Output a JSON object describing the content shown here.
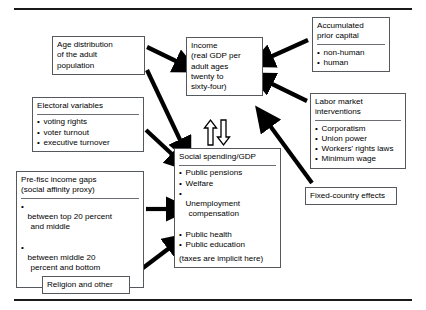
{
  "figure": {
    "type": "flow-diagram",
    "background": "#ffffff",
    "box_border_color": "#55585c",
    "arrow_color": "#000000",
    "rule_color": "#1a1a1a"
  },
  "boxes": {
    "age_distribution": {
      "header": "Age distribution\nof the adult\npopulation",
      "items": []
    },
    "electoral_variables": {
      "header": "Electoral variables",
      "items": [
        "voting rights",
        "voter turnout",
        "executive turnover"
      ]
    },
    "prefisc_income_gaps": {
      "header": "Pre-fisc income gaps\n(social affinity proxy)",
      "items": [
        "between top 20 percent",
        "between middle 20"
      ],
      "item_continuations": [
        "and middle",
        "percent and bottom"
      ]
    },
    "religion_and_other": {
      "header": "Religion and other",
      "items": []
    },
    "income": {
      "header": "Income\n(real GDP per\nadult ages\ntwenty to\nsixty-four)",
      "items": []
    },
    "social_spending": {
      "header": "Social spending/GDP",
      "items": [
        "Public pensions",
        "Welfare",
        "Unemployment",
        "Public health",
        "Public education"
      ],
      "unemployment_continuation": "compensation",
      "note": "(taxes are implicit here)"
    },
    "accumulated_prior_capital": {
      "header": "Accumulated\nprior capital",
      "items": [
        "non-human",
        "human"
      ]
    },
    "labor_market_interventions": {
      "header": "Labor market\ninterventions",
      "items": [
        "Corporatism",
        "Union power",
        "Workers' rights laws",
        "Minimum wage"
      ]
    },
    "fixed_country_effects": {
      "header": "Fixed-country effects",
      "items": []
    }
  },
  "arrows": [
    {
      "from": "age_distribution",
      "to": "income",
      "style": "solid-filled"
    },
    {
      "from": "age_distribution",
      "to": "social_spending",
      "style": "solid-filled"
    },
    {
      "from": "electoral_variables",
      "to": "social_spending",
      "style": "solid-filled"
    },
    {
      "from": "prefisc_income_gaps",
      "to": "social_spending",
      "style": "solid-filled"
    },
    {
      "from": "religion_and_other",
      "to": "social_spending",
      "style": "solid-filled"
    },
    {
      "from": "accumulated_prior_capital",
      "to": "income",
      "style": "solid-filled"
    },
    {
      "from": "labor_market_interventions",
      "to": "income",
      "style": "solid-filled"
    },
    {
      "from": "fixed_country_effects",
      "to": "social_spending",
      "style": "solid-filled"
    },
    {
      "from": "social_spending",
      "to": "income",
      "style": "hollow-outline-up"
    },
    {
      "from": "income",
      "to": "social_spending",
      "style": "hollow-outline-down"
    }
  ]
}
